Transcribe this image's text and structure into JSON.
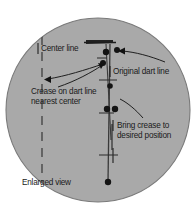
{
  "figure": {
    "caption": "Enlarged view",
    "shape": "circle",
    "fill_color": "#a9a9a9",
    "outline_color": "#6e6e6e",
    "ink_color": "#1a1a1a",
    "background_color": "#ffffff",
    "labels": {
      "center_line": "Center line",
      "original_dart_line": "Original dart line",
      "crease_on_dart_line": "Crease on dart line nearest center",
      "crease_line_1": "Crease on dart line",
      "crease_line_2": "nearest center",
      "bring_crease": "Bring crease to desired position",
      "bring_line_1": "Bring crease to",
      "bring_line_2": "desired position"
    }
  }
}
